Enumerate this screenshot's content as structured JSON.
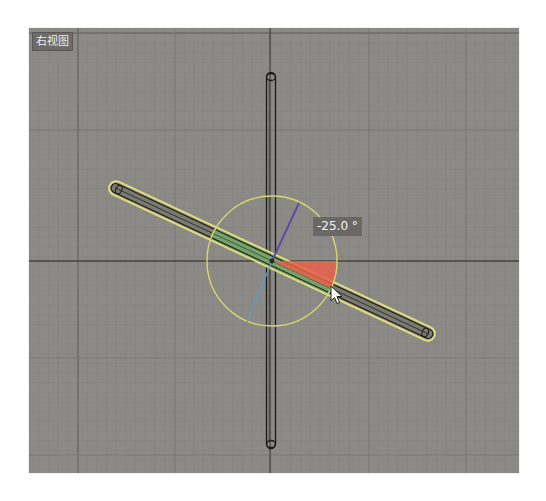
{
  "viewport": {
    "label": "右视图",
    "label_meaning": "Right View",
    "background_color": "#8b8a86",
    "grid": {
      "minor_spacing_px": 9.7,
      "minor_color": "#807f7b",
      "major_color": "#5c5b58",
      "axis_color": "#3e3d3b"
    }
  },
  "gizmo": {
    "type": "rotate",
    "angle_readout": "-25.0 °",
    "angle_value": -25.0,
    "ring_color": "#d8d86a",
    "wedge_color": "#e8624a",
    "x_axis_color": "#5a4a9a",
    "y_axis_color": "#5a9ab8",
    "icons": {
      "cursor": "mouse-pointer-arrow"
    }
  },
  "objects": [
    {
      "name": "vertical-bar",
      "selected": false,
      "outline_color": "#1e1e1e"
    },
    {
      "name": "rotated-bar",
      "selected": true,
      "outline_color": "#1e1e1e",
      "highlight_color": "#e2e27a",
      "inside_gizmo_color": "#6fa86a",
      "rotation_deg": -25.0
    }
  ]
}
